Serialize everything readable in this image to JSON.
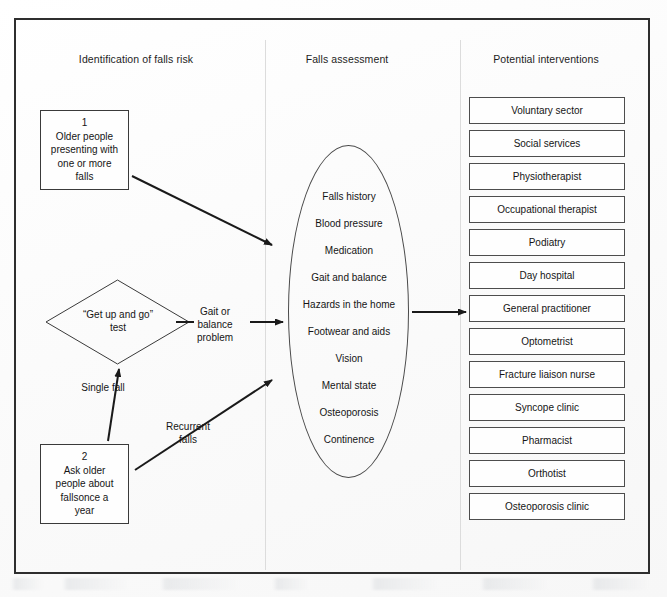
{
  "columns": {
    "identification": "Identification of falls risk",
    "assessment": "Falls assessment",
    "interventions": "Potential interventions"
  },
  "nodes": {
    "box_older_people": "1\nOlder people\npresenting with\none or more\nfalls",
    "diamond_get_up_and_go": "“Get up and go”\ntest",
    "box_ask_older_people": "2\nAsk older\npeople about\nfallsonce a\nyear"
  },
  "edge_labels": {
    "gait_or_balance_problem": "Gait or\nbalance\nproblem",
    "single_fall": "Single fall",
    "recurrent_falls": "Recurrent\nfalls"
  },
  "assessment_items": [
    "Falls history",
    "Blood pressure",
    "Medication",
    "Gait and balance",
    "Hazards in the home",
    "Footwear and aids",
    "Vision",
    "Mental state",
    "Osteoporosis",
    "Continence"
  ],
  "interventions": [
    "Voluntary sector",
    "Social services",
    "Physiotherapist",
    "Occupational therapist",
    "Podiatry",
    "Day hospital",
    "General practitioner",
    "Optometrist",
    "Fracture liaison nurse",
    "Syncope clinic",
    "Pharmacist",
    "Orthotist",
    "Osteoporosis clinic"
  ],
  "colors": {
    "frame": "#2e2e2e",
    "shape_outline": "#3a3a3a",
    "divider": "#dcdcdc",
    "text": "#151515",
    "background": "#fdfdfd"
  }
}
